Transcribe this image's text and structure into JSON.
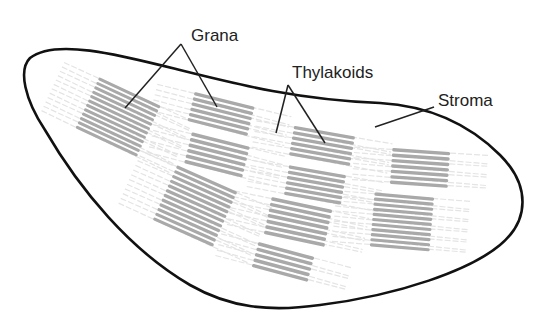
{
  "diagram": {
    "colors": {
      "outline": "#111111",
      "granum": "#a9a9a9",
      "stroma_lamella": "#e4e4e4",
      "leader": "#222222",
      "text": "#222222"
    },
    "labels": [
      {
        "id": "grana",
        "text": "Grana",
        "x": 191,
        "y": 27
      },
      {
        "id": "thylakoids",
        "text": "Thylakoids",
        "x": 292,
        "y": 64
      },
      {
        "id": "stroma",
        "text": "Stroma",
        "x": 438,
        "y": 92
      }
    ],
    "leaders": [
      {
        "label": "grana",
        "from": [
          181,
          44
        ],
        "to": [
          125,
          108
        ]
      },
      {
        "label": "grana",
        "from": [
          181,
          44
        ],
        "to": [
          217,
          107
        ]
      },
      {
        "label": "thylakoids",
        "from": [
          288,
          85
        ],
        "to": [
          276,
          133
        ]
      },
      {
        "label": "thylakoids",
        "from": [
          288,
          85
        ],
        "to": [
          325,
          143
        ]
      },
      {
        "label": "stroma",
        "from": [
          434,
          107
        ],
        "to": [
          375,
          127
        ]
      }
    ],
    "grana_stacks": [
      {
        "cx": 118,
        "cy": 117,
        "w": 68,
        "h": 58,
        "angle": 25,
        "lines": 12
      },
      {
        "cx": 221,
        "cy": 114,
        "w": 62,
        "h": 32,
        "angle": 14,
        "lines": 6
      },
      {
        "cx": 217,
        "cy": 155,
        "w": 60,
        "h": 34,
        "angle": 14,
        "lines": 6
      },
      {
        "cx": 322,
        "cy": 146,
        "w": 62,
        "h": 32,
        "angle": 10,
        "lines": 6
      },
      {
        "cx": 420,
        "cy": 168,
        "w": 58,
        "h": 38,
        "angle": 4,
        "lines": 7
      },
      {
        "cx": 195,
        "cy": 206,
        "w": 66,
        "h": 62,
        "angle": 24,
        "lines": 12
      },
      {
        "cx": 315,
        "cy": 185,
        "w": 58,
        "h": 32,
        "angle": 10,
        "lines": 6
      },
      {
        "cx": 298,
        "cy": 222,
        "w": 62,
        "h": 40,
        "angle": 12,
        "lines": 7
      },
      {
        "cx": 402,
        "cy": 222,
        "w": 60,
        "h": 56,
        "angle": 5,
        "lines": 11
      },
      {
        "cx": 283,
        "cy": 262,
        "w": 58,
        "h": 28,
        "angle": 15,
        "lines": 5
      }
    ]
  }
}
